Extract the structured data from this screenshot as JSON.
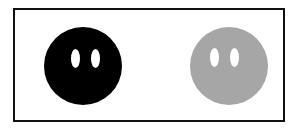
{
  "figure": {
    "frame": {
      "border_color": "#111111",
      "background": "#ffffff"
    },
    "faces": [
      {
        "id": "black-face",
        "color": "#000000",
        "eye_color": "#ffffff",
        "eye_count": 2
      },
      {
        "id": "gray-face",
        "color": "#a6a6a6",
        "eye_color": "#ffffff",
        "eye_count": 2
      }
    ]
  }
}
